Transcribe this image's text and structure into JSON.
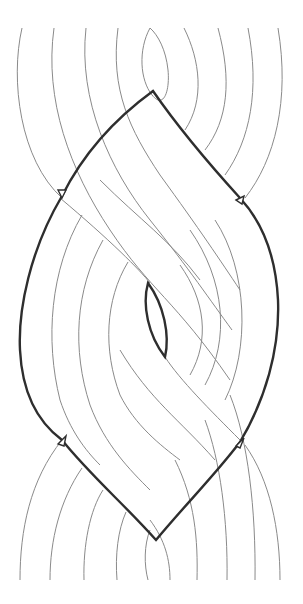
{
  "diagram": {
    "type": "braid-knot-diagram",
    "width": 303,
    "height": 604,
    "colors": {
      "background": "#ffffff",
      "strand": "#8a8a8a",
      "contour": "#2e2e2e"
    },
    "strand_count_top": 9,
    "strand_count_bottom": 9,
    "outer_contour": {
      "top_vertex": [
        153,
        91
      ],
      "bottom_vertex": [
        156,
        540
      ],
      "left_notches": [
        [
          62,
          196
        ],
        [
          62,
          440
        ]
      ],
      "right_notches": [
        [
          240,
          198
        ],
        [
          240,
          442
        ]
      ]
    },
    "inner_lens": {
      "top": [
        148,
        283
      ],
      "bottom": [
        165,
        357
      ]
    }
  }
}
